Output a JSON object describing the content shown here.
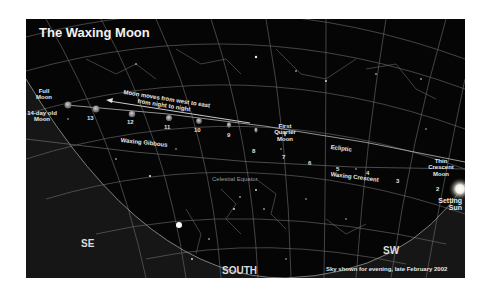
{
  "title": "The Waxing Moon",
  "labels": {
    "full_moon": "Full Moon",
    "old_moon": "14-day old Moon",
    "motion_note_line1": "Moon moves from west to east",
    "motion_note_line2": "from night to night",
    "waxing_gibbous": "Waxing Gibbous",
    "first_quarter": "First Quarter Moon",
    "ecliptic": "Ecliptic",
    "celestial_equator": "Celestial Equator",
    "waxing_crescent": "Waxing Crescent",
    "thin_crescent": "Thin Crescent Moon",
    "setting_sun": "Setting Sun",
    "caption": "Sky shown for evening, late February 2002"
  },
  "directions": {
    "se": "SE",
    "south": "SOUTH",
    "sw": "SW"
  },
  "moon_days": [
    {
      "day": "13",
      "x": 69,
      "y": 76
    },
    {
      "day": "12",
      "x": 106,
      "y": 82
    },
    {
      "day": "11",
      "x": 142,
      "y": 87
    },
    {
      "day": "10",
      "x": 174,
      "y": 89
    },
    {
      "day": "9",
      "x": 203,
      "y": 93
    },
    {
      "day": "8",
      "x": 228,
      "y": 97
    },
    {
      "day": "7",
      "x": 259,
      "y": 102
    },
    {
      "day": "6",
      "x": 285,
      "y": 106
    },
    {
      "day": "5",
      "x": 315,
      "y": 113
    },
    {
      "day": "4",
      "x": 345,
      "y": 118
    },
    {
      "day": "3",
      "x": 373,
      "y": 123
    },
    {
      "day": "2",
      "x": 413,
      "y": 129
    }
  ],
  "colors": {
    "sky": "#050505",
    "ground": "#161616",
    "grid": "#8a8a8a",
    "text": "#e8e8e8",
    "sun": "#ffffff"
  }
}
